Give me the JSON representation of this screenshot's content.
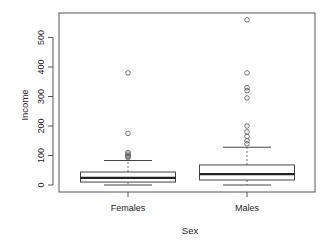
{
  "chart_data": {
    "type": "boxplot",
    "title": "",
    "xlabel": "Sex",
    "ylabel": "Income",
    "categories": [
      "Females",
      "Males"
    ],
    "y_ticks": [
      0,
      100,
      200,
      300,
      400,
      500
    ],
    "ylim": [
      -25,
      580
    ],
    "grid": false,
    "legend": null,
    "series": [
      {
        "name": "Females",
        "whisker_low": 0,
        "q1": 10,
        "median": 24,
        "q3": 44,
        "whisker_high": 83,
        "outliers": [
          380,
          175,
          110,
          105,
          100,
          97,
          93
        ]
      },
      {
        "name": "Males",
        "whisker_low": 0,
        "q1": 17,
        "median": 37,
        "q3": 68,
        "whisker_high": 128,
        "outliers": [
          560,
          380,
          330,
          320,
          295,
          200,
          180,
          165,
          150,
          140
        ]
      }
    ]
  },
  "colors": {
    "frame": "#555555",
    "box": "#444444",
    "median": "#222222",
    "outlier": "#555555"
  }
}
